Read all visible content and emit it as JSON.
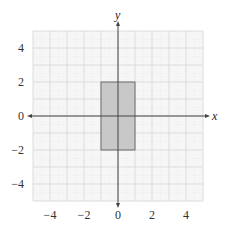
{
  "chart_data": {
    "type": "coordinate-plane",
    "title": "",
    "xlabel": "x",
    "ylabel": "y",
    "xlim": [
      -5,
      5
    ],
    "ylim": [
      -5,
      5
    ],
    "grid": true,
    "x_ticks": [
      "−4",
      "−2",
      "0",
      "2",
      "4"
    ],
    "y_ticks": [
      "4",
      "2",
      "0",
      "−2",
      "−4"
    ],
    "shapes": [
      {
        "type": "rectangle",
        "vertices": [
          [
            -1,
            2
          ],
          [
            1,
            2
          ],
          [
            1,
            -2
          ],
          [
            -1,
            -2
          ]
        ],
        "fill": "#c8c8c8",
        "stroke": "#6a6a6a"
      }
    ]
  },
  "colors": {
    "background": "#f6f6f6",
    "grid": "#dcdcdc",
    "axis": "#444444",
    "shape_fill": "#c8c8c8",
    "shape_stroke": "#6a6a6a"
  }
}
